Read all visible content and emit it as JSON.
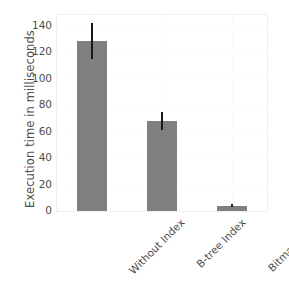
{
  "chart_data": {
    "type": "bar",
    "title": "",
    "xlabel": "",
    "ylabel": "Execution time in milliseconds",
    "categories": [
      "Without Index",
      "B-tree Index",
      "Bitmap Index"
    ],
    "values": [
      128.5,
      68.0,
      4.0
    ],
    "errors": [
      13.5,
      6.5,
      1.0
    ],
    "ylim": [
      0,
      148
    ],
    "yticks": [
      0,
      20,
      40,
      60,
      80,
      100,
      120,
      140
    ],
    "ytick_labels": [
      "0",
      "20",
      "40",
      "60",
      "80",
      "100",
      "120",
      "140"
    ],
    "grid": true,
    "legend": "none",
    "bar_color": "#808080",
    "error_color": "#1a1a1a",
    "text_color": "#4d4d4d",
    "background_color": "#ffffff",
    "xtick_rotation": 45
  }
}
